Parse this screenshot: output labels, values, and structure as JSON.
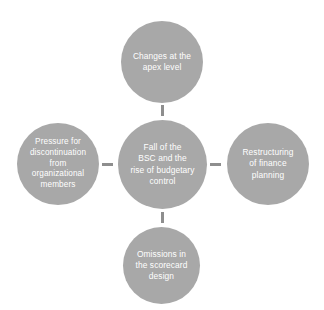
{
  "diagram": {
    "type": "radial-hub-and-spoke",
    "background_color": "#ffffff",
    "node_color": "#a8a8a8",
    "node_text_color": "#ffffff",
    "connector_color": "#8e8e8e",
    "center": {
      "id": "fall-of-bsc",
      "label": "Fall of the\nBSC and the\nrise of budgetary\ncontrol"
    },
    "satellites": [
      {
        "id": "changes-apex-level",
        "position": "top",
        "label": "Changes at the\napex level"
      },
      {
        "id": "pressure-discontinuation",
        "position": "left",
        "label": "Pressure for\ndiscontinuation\nfrom\norganizational\nmembers"
      },
      {
        "id": "restructuring-finance-planning",
        "position": "right",
        "label": "Restructuring\nof finance\nplanning"
      },
      {
        "id": "omissions-scorecard-design",
        "position": "bottom",
        "label": "Omissions in\nthe scorecard\ndesign"
      }
    ],
    "connectors": [
      {
        "id": "center-to-top",
        "orientation": "vertical"
      },
      {
        "id": "center-to-bottom",
        "orientation": "vertical"
      },
      {
        "id": "center-to-left",
        "orientation": "horizontal"
      },
      {
        "id": "center-to-right",
        "orientation": "horizontal"
      }
    ]
  }
}
